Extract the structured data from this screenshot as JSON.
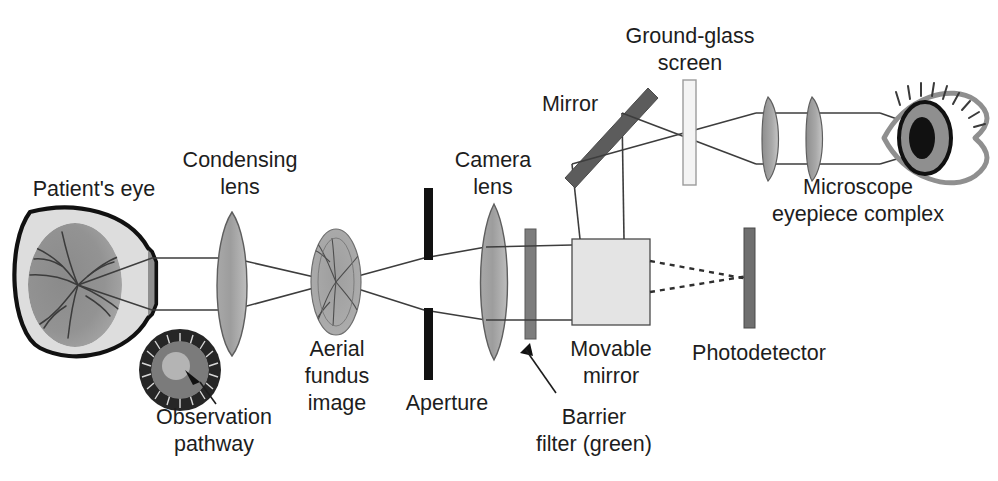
{
  "figure": {
    "type": "optical-ray-diagram"
  },
  "labels": {
    "patients_eye": "Patient's eye",
    "condensing_lens_line1": "Condensing",
    "condensing_lens_line2": "lens",
    "observation_line1": "Observation",
    "observation_line2": "pathway",
    "aerial_line1": "Aerial",
    "aerial_line2": "fundus",
    "aerial_line3": "image",
    "aperture": "Aperture",
    "camera_lens_line1": "Camera",
    "camera_lens_line2": "lens",
    "barrier_filter_line1": "Barrier",
    "barrier_filter_line2": "filter (green)",
    "movable_mirror_line1": "Movable",
    "movable_mirror_line2": "mirror",
    "mirror": "Mirror",
    "ground_glass_line1": "Ground-glass",
    "ground_glass_line2": "screen",
    "photodetector": "Photodetector",
    "microscope_line1": "Microscope",
    "microscope_line2": "eyepiece complex"
  },
  "components": [
    {
      "id": "patients-eye",
      "name": "Patient's eye",
      "kind": "eye"
    },
    {
      "id": "observation-pathway-inset",
      "name": "Observation pathway",
      "kind": "annulus-inset"
    },
    {
      "id": "condensing-lens",
      "name": "Condensing lens",
      "kind": "biconvex-lens"
    },
    {
      "id": "aerial-fundus-image",
      "name": "Aerial fundus image",
      "kind": "image-plane"
    },
    {
      "id": "aperture",
      "name": "Aperture",
      "kind": "opaque-bar"
    },
    {
      "id": "camera-lens",
      "name": "Camera lens",
      "kind": "biconvex-lens"
    },
    {
      "id": "barrier-filter",
      "name": "Barrier filter (green)",
      "kind": "filter-bar"
    },
    {
      "id": "movable-mirror",
      "name": "Movable mirror",
      "kind": "square-block"
    },
    {
      "id": "photodetector",
      "name": "Photodetector",
      "kind": "detector-bar"
    },
    {
      "id": "mirror",
      "name": "Mirror",
      "kind": "tilted-bar"
    },
    {
      "id": "ground-glass-screen",
      "name": "Ground-glass screen",
      "kind": "screen-bar"
    },
    {
      "id": "microscope-eyepiece-complex",
      "name": "Microscope eyepiece complex",
      "kind": "lens-pair"
    },
    {
      "id": "observer-eye",
      "name": "Observer eye",
      "kind": "eye-outline"
    }
  ],
  "colors": {
    "ink": "#1d1d1d",
    "ray": "#3d3d3d",
    "glass_mid": "#9a9a9a",
    "glass_light": "#c9c9c9",
    "eye_fill": "#dcdcdc",
    "retina": "#8f8f8f",
    "block_fill": "#e2e2e2",
    "dark_bar": "#6e6e6e",
    "screen_fill": "#f2f2f2",
    "black": "#111111",
    "inset_ring": "#2b2b2b"
  }
}
